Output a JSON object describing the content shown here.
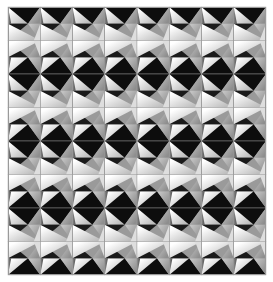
{
  "artwork": {
    "title": "Geometric Tessellation Pattern",
    "description": "Repeating grid of shaded triangular facets forming a folded-paper / pyramid optical illusion",
    "motif_name": "zigzag-arrow-facet-tile",
    "canvas": {
      "width": 273,
      "height": 282,
      "background": "#ffffff"
    },
    "pattern_area": {
      "x": 8,
      "y": 7,
      "width": 258,
      "height": 268
    },
    "grid": {
      "columns": 8,
      "rows": 8,
      "tile_width": 32.25,
      "tile_height": 33.5
    },
    "row_orientation_cycle": [
      "up",
      "down"
    ],
    "column_orientation_cycle": [
      "normal"
    ],
    "seam_color": "#9a9a9a",
    "seam_width": 0.45,
    "palette": {
      "black": "#0d0d0d",
      "near_black": "#1a1a1a",
      "dark_gray": "#6e6e6e",
      "mid_gray": "#a8a8a8",
      "light_gray": "#c9c9c9",
      "pale_gray": "#dedede",
      "off_white": "#f2f2f2",
      "white": "#fbfbfb"
    },
    "facets": [
      {
        "name": "upper-black-wedge",
        "shade": "black",
        "hex": "#0d0d0d"
      },
      {
        "name": "upper-light-blade",
        "shade": "off_white",
        "hex": "#f2f2f2"
      },
      {
        "name": "upper-gray-plane",
        "shade": "mid_gray",
        "hex": "#a8a8a8"
      },
      {
        "name": "lower-black-notch",
        "shade": "near_black",
        "hex": "#1a1a1a"
      },
      {
        "name": "lower-white-blade",
        "shade": "white",
        "hex": "#fbfbfb"
      },
      {
        "name": "lower-gray-plane",
        "shade": "light_gray",
        "hex": "#c9c9c9"
      },
      {
        "name": "left-dark-sliver",
        "shade": "dark_gray",
        "hex": "#6e6e6e"
      },
      {
        "name": "right-pale-sliver",
        "shade": "pale_gray",
        "hex": "#dedede"
      }
    ],
    "gradients": [
      {
        "name": "blade-gradient",
        "from": "#ffffff",
        "to": "#bdbdbd",
        "angle_deg": 135
      },
      {
        "name": "plane-gradient",
        "from": "#c2c2c2",
        "to": "#8e8e8e",
        "angle_deg": 135
      },
      {
        "name": "sliver-gradient",
        "from": "#8a8a8a",
        "to": "#505050",
        "angle_deg": 90
      }
    ]
  },
  "chart_data": {
    "type": "heatmap",
    "xlabel": "",
    "ylabel": "",
    "categories": [
      "c1",
      "c2",
      "c3",
      "c4",
      "c5",
      "c6",
      "c7",
      "c8"
    ],
    "rows": [
      "r1",
      "r2",
      "r3",
      "r4",
      "r5",
      "r6",
      "r7",
      "r8"
    ],
    "grid": true,
    "legend": "none",
    "values": [
      [
        1,
        1,
        1,
        1,
        1,
        1,
        1,
        1
      ],
      [
        0,
        0,
        0,
        0,
        0,
        0,
        0,
        0
      ],
      [
        1,
        1,
        1,
        1,
        1,
        1,
        1,
        1
      ],
      [
        0,
        0,
        0,
        0,
        0,
        0,
        0,
        0
      ],
      [
        1,
        1,
        1,
        1,
        1,
        1,
        1,
        1
      ],
      [
        0,
        0,
        0,
        0,
        0,
        0,
        0,
        0
      ],
      [
        1,
        1,
        1,
        1,
        1,
        1,
        1,
        1
      ],
      [
        0,
        0,
        0,
        0,
        0,
        0,
        0,
        0
      ]
    ],
    "value_meaning": {
      "1": "tile-orientation-up",
      "0": "tile-orientation-down"
    }
  }
}
